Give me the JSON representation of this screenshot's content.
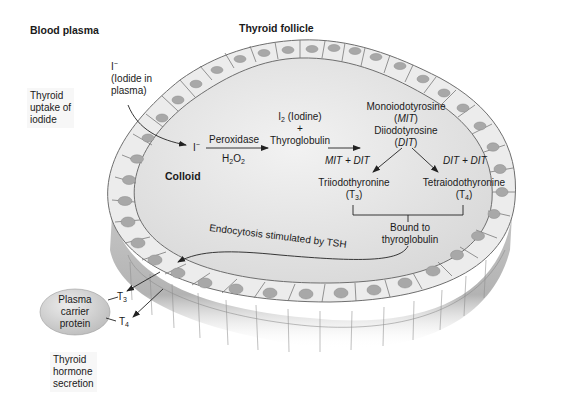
{
  "title": "Thyroid follicle",
  "regions": {
    "blood_plasma": "Blood plasma",
    "colloid": "Colloid"
  },
  "side_labels": {
    "uptake": [
      "Thyroid",
      "uptake of",
      "iodide"
    ],
    "secretion": [
      "Thyroid",
      "hormone",
      "secretion"
    ]
  },
  "iodide_plasma": {
    "symbol": "I",
    "charge": "−",
    "line1": "(Iodide in",
    "line2": "plasma)"
  },
  "pathway": {
    "iodide": {
      "symbol": "I",
      "charge": "−"
    },
    "step1": {
      "enzyme": "Peroxidase",
      "cofactor_base": "H",
      "cofactor_sub1": "2",
      "cofactor_mid": "O",
      "cofactor_sub2": "2"
    },
    "product1": {
      "iodine_base": "I",
      "iodine_sub": "2",
      "iodine_name": " (Iodine)",
      "plus": "+",
      "protein": "Thyroglobulin"
    },
    "product2": {
      "mit_name": "Monoiodotyrosine",
      "mit_abbr": "MIT",
      "dit_name": "Diiodotyrosine",
      "dit_abbr": "DIT"
    },
    "branch_left": {
      "reaction": "MIT + DIT",
      "name": "Triiodothyronine",
      "abbr_base": "T",
      "abbr_sub": "3"
    },
    "branch_right": {
      "reaction": "DIT + DIT",
      "name": "Tetraiodothyronine",
      "abbr_base": "T",
      "abbr_sub": "4"
    },
    "bound": [
      "Bound to",
      "thyroglobulin"
    ],
    "endocytosis": "Endocytosis stimulated by TSH"
  },
  "secretion": {
    "carrier": [
      "Plasma",
      "carrier",
      "protein"
    ],
    "t3": {
      "base": "T",
      "sub": "3"
    },
    "t4": {
      "base": "T",
      "sub": "4"
    }
  },
  "colors": {
    "colloid": "#e6e6e6",
    "cell_top": "#eeeeee",
    "cell_side": "#bdbdbd",
    "nucleus": "#a8a8a8",
    "outline": "#6e6e6e",
    "arrow": "#222222",
    "carrier": "#cfcfcf"
  }
}
